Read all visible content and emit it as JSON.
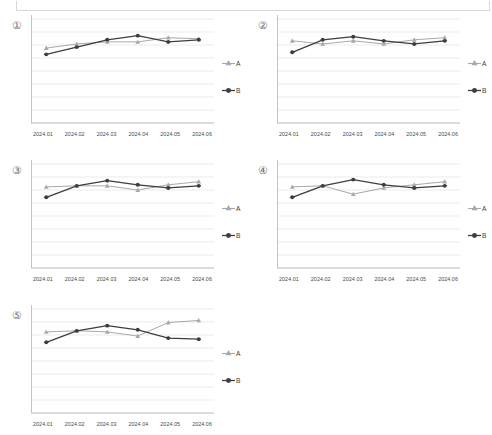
{
  "page": {
    "background": "#ffffff",
    "top_frame_present": true
  },
  "style": {
    "series_a_color": "#a9a9ad",
    "series_b_color": "#3d3d42",
    "gridline_color": "#e6e6e6",
    "axis_color": "#bdbdbd",
    "tick_label_color": "#4a4a4a"
  },
  "legend": {
    "series": [
      {
        "label": "A",
        "marker": "triangle-marker-icon",
        "color": "#a9a9ad"
      },
      {
        "label": "B",
        "marker": "diamond-marker-icon",
        "color": "#3d3d42"
      }
    ]
  },
  "axis": {
    "categories": [
      "2024.01",
      "2024.02",
      "2024.03",
      "2024.04",
      "2024.05",
      "2024.06"
    ],
    "gridlines": 9,
    "ylim": [
      0,
      100
    ]
  },
  "panels": [
    {
      "number": "①",
      "id": "chart-1"
    },
    {
      "number": "②",
      "id": "chart-2"
    },
    {
      "number": "③",
      "id": "chart-3"
    },
    {
      "number": "④",
      "id": "chart-4"
    },
    {
      "number": "⑤",
      "id": "chart-5"
    }
  ],
  "chart_data": [
    {
      "type": "line",
      "title": "①",
      "xlabel": "",
      "ylabel": "",
      "categories": [
        "2024.01",
        "2024.02",
        "2024.03",
        "2024.04",
        "2024.05",
        "2024.06"
      ],
      "ylim": [
        0,
        100
      ],
      "grid": true,
      "legend_position": "right",
      "series": [
        {
          "name": "A",
          "values": [
            72,
            76,
            78,
            78,
            82,
            81
          ]
        },
        {
          "name": "B",
          "values": [
            66,
            73,
            80,
            84,
            78,
            80
          ]
        }
      ]
    },
    {
      "type": "line",
      "title": "②",
      "xlabel": "",
      "ylabel": "",
      "categories": [
        "2024.01",
        "2024.02",
        "2024.03",
        "2024.04",
        "2024.05",
        "2024.06"
      ],
      "ylim": [
        0,
        100
      ],
      "grid": true,
      "legend_position": "right",
      "series": [
        {
          "name": "A",
          "values": [
            79,
            76,
            79,
            76,
            80,
            82
          ]
        },
        {
          "name": "B",
          "values": [
            68,
            80,
            83,
            79,
            76,
            79
          ]
        }
      ]
    },
    {
      "type": "line",
      "title": "③",
      "xlabel": "",
      "ylabel": "",
      "categories": [
        "2024.01",
        "2024.02",
        "2024.03",
        "2024.04",
        "2024.05",
        "2024.06"
      ],
      "ylim": [
        0,
        100
      ],
      "grid": true,
      "legend_position": "right",
      "series": [
        {
          "name": "A",
          "values": [
            78,
            79,
            79,
            75,
            80,
            83
          ]
        },
        {
          "name": "B",
          "values": [
            68,
            79,
            84,
            80,
            77,
            79
          ]
        }
      ]
    },
    {
      "type": "line",
      "title": "④",
      "xlabel": "",
      "ylabel": "",
      "categories": [
        "2024.01",
        "2024.02",
        "2024.03",
        "2024.04",
        "2024.05",
        "2024.06"
      ],
      "ylim": [
        0,
        100
      ],
      "grid": true,
      "legend_position": "right",
      "series": [
        {
          "name": "A",
          "values": [
            78,
            79,
            71,
            77,
            80,
            83
          ]
        },
        {
          "name": "B",
          "values": [
            68,
            79,
            85,
            80,
            77,
            79
          ]
        }
      ]
    },
    {
      "type": "line",
      "title": "⑤",
      "xlabel": "",
      "ylabel": "",
      "categories": [
        "2024.01",
        "2024.02",
        "2024.03",
        "2024.04",
        "2024.05",
        "2024.06"
      ],
      "ylim": [
        0,
        100
      ],
      "grid": true,
      "legend_position": "right",
      "series": [
        {
          "name": "A",
          "values": [
            78,
            79,
            78,
            74,
            87,
            89
          ]
        },
        {
          "name": "B",
          "values": [
            68,
            79,
            84,
            80,
            72,
            71
          ]
        }
      ]
    }
  ]
}
